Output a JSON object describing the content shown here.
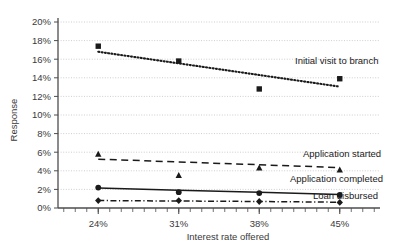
{
  "chart_data": {
    "type": "line",
    "title": "",
    "xlabel": "Interest rate offered",
    "ylabel": "Response",
    "categories": [
      "24%",
      "31%",
      "38%",
      "45%"
    ],
    "x": [
      24,
      31,
      38,
      45
    ],
    "xlim": [
      20.5,
      48.5
    ],
    "ylim": [
      0,
      20
    ],
    "ytick_labels": [
      "0%",
      "2%",
      "4%",
      "6%",
      "8%",
      "10%",
      "12%",
      "14%",
      "16%",
      "18%",
      "20%"
    ],
    "ytick_values": [
      0,
      2,
      4,
      6,
      8,
      10,
      12,
      14,
      16,
      18,
      20
    ],
    "grid": "horizontal-dotted",
    "legend_position": "inline-right-of-series",
    "series": [
      {
        "name": "Initial visit to branch",
        "values": [
          17.4,
          15.8,
          12.8,
          13.9
        ],
        "marker": "square",
        "linestyle": "dotted",
        "color": "#1a1a1a",
        "label": "Initial visit to branch",
        "trend": [
          16.8,
          15.55,
          14.3,
          13.05
        ]
      },
      {
        "name": "Application started",
        "values": [
          5.8,
          3.5,
          4.3,
          4.1
        ],
        "marker": "triangle",
        "linestyle": "dashed",
        "color": "#1a1a1a",
        "label": "Application started",
        "trend": [
          5.25,
          4.95,
          4.65,
          4.35
        ]
      },
      {
        "name": "Application completed",
        "values": [
          2.2,
          1.7,
          1.6,
          1.4
        ],
        "marker": "circle",
        "linestyle": "solid",
        "color": "#1a1a1a",
        "label": "Application completed",
        "trend": [
          2.15,
          1.9,
          1.7,
          1.45
        ]
      },
      {
        "name": "Loan disbursed",
        "values": [
          0.8,
          0.8,
          0.7,
          0.6
        ],
        "marker": "diamond",
        "linestyle": "dash-dot",
        "color": "#1a1a1a",
        "label": "Loan disbursed",
        "trend": [
          0.8,
          0.75,
          0.7,
          0.62
        ]
      }
    ],
    "annotations": [
      {
        "text": "Initial visit to branch",
        "x": 295,
        "y": 64
      },
      {
        "text": "Application started",
        "x": 303,
        "y": 157
      },
      {
        "text": "Application completed",
        "x": 290,
        "y": 182
      },
      {
        "text": "Loan disbursed",
        "x": 313,
        "y": 199
      }
    ]
  },
  "colors": {
    "axis": "#4d4d4d",
    "grid": "#c8c8c8",
    "text": "#3a3a3a",
    "series": "#1a1a1a",
    "background": "#ffffff"
  }
}
